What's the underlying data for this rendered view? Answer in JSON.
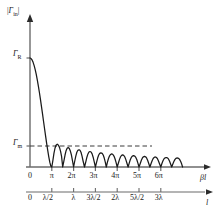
{
  "chart_data": {
    "type": "line",
    "title": "",
    "ylabel": "|Γin|",
    "xlabel": "βl",
    "xlabel_secondary": "l",
    "grid": false,
    "legend": false,
    "axis_primary_ticks": [
      "0",
      "π",
      "2π",
      "3π",
      "4π",
      "5π",
      "6π"
    ],
    "axis_secondary_ticks": [
      "0",
      "λ/2",
      "λ",
      "3λ/2",
      "2λ",
      "5λ/2",
      "3λ"
    ],
    "y_ticks": [
      "ΓR",
      "Γm"
    ],
    "y_tick_values": [
      1.0,
      0.22
    ],
    "xlim": [
      0,
      7.2
    ],
    "ylim": [
      0,
      1.12
    ],
    "annotations": [
      {
        "text": "Γm",
        "type": "dashed-reference-line",
        "y": 0.22
      }
    ],
    "series": [
      {
        "name": "|Γin|",
        "description": "Reflection coefficient magnitude: monotonic decay from ΓR to zero at βl = π, then decaying oscillatory lobes with zeros at multiples of π",
        "x": [
          0.0,
          0.15,
          0.3,
          0.45,
          0.6,
          0.75,
          0.9,
          1.05,
          1.2,
          1.35,
          1.5,
          1.65,
          1.8,
          1.95,
          2.1,
          2.25,
          2.4,
          2.55,
          2.7,
          2.85,
          3.0,
          3.14159,
          3.3,
          3.45,
          3.6,
          3.75,
          3.92699,
          4.1,
          4.25,
          4.4,
          4.55,
          4.71239,
          4.9,
          5.05,
          5.2,
          5.35,
          5.5,
          5.65,
          5.8,
          5.95,
          6.1,
          6.28319,
          6.45,
          6.6,
          6.75,
          6.9,
          7.06858,
          7.2,
          7.35,
          7.5,
          7.65,
          7.85398,
          8.05,
          8.2,
          8.35,
          8.5,
          8.63938,
          8.8,
          8.95,
          9.1,
          9.25,
          9.42478,
          9.6,
          9.75,
          9.9,
          10.05,
          10.21018,
          10.4,
          10.55,
          10.7,
          10.85,
          10.99557,
          11.15,
          11.3,
          11.45,
          11.6,
          11.78097,
          11.95,
          12.1,
          12.25,
          12.4,
          12.56637,
          12.75,
          12.9,
          13.05,
          13.2,
          13.35,
          13.5,
          13.65,
          13.8,
          13.95,
          14.13717,
          14.3,
          14.45,
          14.6,
          14.75,
          14.92257,
          15.1,
          15.25,
          15.4,
          15.55,
          15.70796,
          15.9,
          16.05,
          16.2,
          16.35,
          16.49336,
          16.65,
          16.8,
          16.95,
          17.1,
          17.27876,
          17.45,
          17.6,
          17.75,
          17.9,
          18.06416,
          18.2,
          18.35,
          18.5,
          18.65,
          18.84956,
          19.0,
          19.15,
          19.3,
          19.45,
          19.63495,
          19.8,
          19.95,
          20.1,
          20.25,
          20.42035,
          20.6,
          20.75,
          20.9,
          21.05,
          21.20575,
          21.4,
          21.55,
          21.7,
          21.85,
          21.99115
        ],
        "y": [
          1.0,
          0.995,
          0.982,
          0.96,
          0.93,
          0.893,
          0.85,
          0.8,
          0.745,
          0.686,
          0.623,
          0.557,
          0.489,
          0.42,
          0.351,
          0.283,
          0.217,
          0.154,
          0.096,
          0.044,
          0.008,
          0.0,
          0.06,
          0.125,
          0.172,
          0.2,
          0.21,
          0.2,
          0.18,
          0.145,
          0.098,
          0.0,
          0.06,
          0.11,
          0.15,
          0.172,
          0.178,
          0.172,
          0.15,
          0.115,
          0.065,
          0.0,
          0.055,
          0.1,
          0.135,
          0.153,
          0.158,
          0.153,
          0.135,
          0.1,
          0.055,
          0.0,
          0.05,
          0.09,
          0.12,
          0.138,
          0.142,
          0.138,
          0.12,
          0.09,
          0.05,
          0.0,
          0.045,
          0.082,
          0.11,
          0.125,
          0.13,
          0.125,
          0.11,
          0.082,
          0.045,
          0.0,
          0.042,
          0.076,
          0.1,
          0.115,
          0.12,
          0.115,
          0.1,
          0.076,
          0.042,
          0.0,
          0.039,
          0.07,
          0.094,
          0.107,
          0.111,
          0.107,
          0.094,
          0.07,
          0.039,
          0.0,
          0.036,
          0.066,
          0.088,
          0.1,
          0.104,
          0.1,
          0.088,
          0.066,
          0.036,
          0.0,
          0.034,
          0.062,
          0.083,
          0.094,
          0.098,
          0.094,
          0.083,
          0.062,
          0.034,
          0.0,
          0.032,
          0.058,
          0.078,
          0.089,
          0.092,
          0.089,
          0.078,
          0.058,
          0.032,
          0.0,
          0.03,
          0.055,
          0.074,
          0.084,
          0.087,
          0.084,
          0.074,
          0.055,
          0.03,
          0.0,
          0.029,
          0.052,
          0.07,
          0.08,
          0.083,
          0.08,
          0.07,
          0.052,
          0.029,
          0.0
        ]
      }
    ]
  },
  "figure": {
    "ylabel_main": "|",
    "ylabel_gamma": "Γ",
    "ylabel_sub": "in",
    "ylabel_close": "|",
    "gamma_R_symbol": "Γ",
    "gamma_R_sub": "R",
    "gamma_m_symbol": "Γ",
    "gamma_m_sub": "m",
    "xaxis1_label": "βl",
    "xaxis2_label": "l",
    "ticks1": [
      {
        "label": "0"
      },
      {
        "label": "π"
      },
      {
        "label": "2π"
      },
      {
        "label": "3π"
      },
      {
        "label": "4π"
      },
      {
        "label": "5π"
      },
      {
        "label": "6π"
      }
    ],
    "ticks2": [
      {
        "label": "0"
      },
      {
        "label": "λ/2"
      },
      {
        "label": "λ"
      },
      {
        "label": "3λ/2"
      },
      {
        "label": "2λ"
      },
      {
        "label": "5λ/2"
      },
      {
        "label": "3λ"
      }
    ],
    "colors": {
      "curve": "#1a1a1a",
      "axis": "#6b6b6b",
      "dashed": "#3a3a3a",
      "background": "#ffffff"
    }
  }
}
